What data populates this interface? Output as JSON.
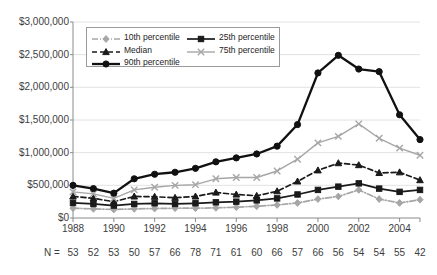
{
  "chart_data": {
    "type": "line",
    "title": "",
    "xlabel": "",
    "ylabel": "",
    "x": [
      1988,
      1989,
      1990,
      1991,
      1992,
      1993,
      1994,
      1995,
      1996,
      1997,
      1998,
      1999,
      2000,
      2001,
      2002,
      2003,
      2004,
      2005
    ],
    "xlim": [
      1988,
      2005
    ],
    "ylim": [
      0,
      3000000
    ],
    "ytick_labels": [
      "$0",
      "$500,000",
      "$1,000,000",
      "$1,500,000",
      "$2,000,000",
      "$2,500,000",
      "$3,000,000"
    ],
    "ytick_values": [
      0,
      500000,
      1000000,
      1500000,
      2000000,
      2500000,
      3000000
    ],
    "xtick_labels": [
      "1988",
      "1990",
      "1992",
      "1994",
      "1996",
      "1998",
      "2000",
      "2002",
      "2004"
    ],
    "xtick_values": [
      1988,
      1990,
      1992,
      1994,
      1996,
      1998,
      2000,
      2002,
      2004
    ],
    "grid": true,
    "legend_position": "upper-left-inside",
    "series": [
      {
        "name": "10th percentile",
        "color": "#a6a6a6",
        "marker": "diamond",
        "dash": "dashdot",
        "values": [
          150000,
          140000,
          130000,
          140000,
          145000,
          150000,
          150000,
          155000,
          165000,
          180000,
          200000,
          230000,
          290000,
          330000,
          430000,
          290000,
          230000,
          280000
        ]
      },
      {
        "name": "25th percentile",
        "color": "#1a1a1a",
        "marker": "square",
        "dash": "solid",
        "values": [
          230000,
          215000,
          190000,
          215000,
          225000,
          215000,
          225000,
          240000,
          250000,
          270000,
          300000,
          360000,
          430000,
          480000,
          530000,
          450000,
          400000,
          430000
        ]
      },
      {
        "name": "Median",
        "color": "#1a1a1a",
        "marker": "triangle",
        "dash": "dashed",
        "values": [
          330000,
          300000,
          250000,
          330000,
          325000,
          310000,
          330000,
          390000,
          360000,
          340000,
          410000,
          560000,
          730000,
          840000,
          810000,
          690000,
          700000,
          580000
        ]
      },
      {
        "name": "75th percentile",
        "color": "#a6a6a6",
        "marker": "x",
        "dash": "solid",
        "values": [
          400000,
          370000,
          300000,
          430000,
          470000,
          500000,
          510000,
          600000,
          620000,
          620000,
          720000,
          900000,
          1150000,
          1250000,
          1440000,
          1220000,
          1070000,
          960000
        ]
      },
      {
        "name": "90th percentile",
        "color": "#111111",
        "marker": "circle",
        "dash": "solid",
        "values": [
          500000,
          450000,
          380000,
          600000,
          670000,
          700000,
          760000,
          860000,
          920000,
          980000,
          1100000,
          1430000,
          2220000,
          2490000,
          2280000,
          2240000,
          1580000,
          1200000
        ]
      }
    ],
    "n_row": {
      "label": "N =",
      "values": [
        53,
        52,
        53,
        50,
        57,
        66,
        78,
        71,
        61,
        60,
        66,
        57,
        66,
        56,
        54,
        54,
        55,
        42
      ]
    }
  }
}
